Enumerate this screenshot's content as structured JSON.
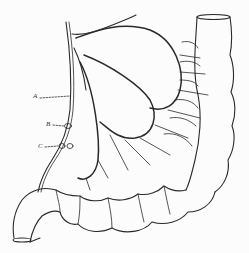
{
  "figure": {
    "type": "anatomical line drawing",
    "labels": [
      {
        "id": "A",
        "text": "A",
        "x": 33,
        "y": 97
      },
      {
        "id": "B",
        "text": "B",
        "x": 46,
        "y": 124
      },
      {
        "id": "C",
        "text": "C",
        "x": 38,
        "y": 146
      }
    ],
    "colors": {
      "line": "#2a2a2a",
      "background": "#fcfcfc"
    }
  }
}
